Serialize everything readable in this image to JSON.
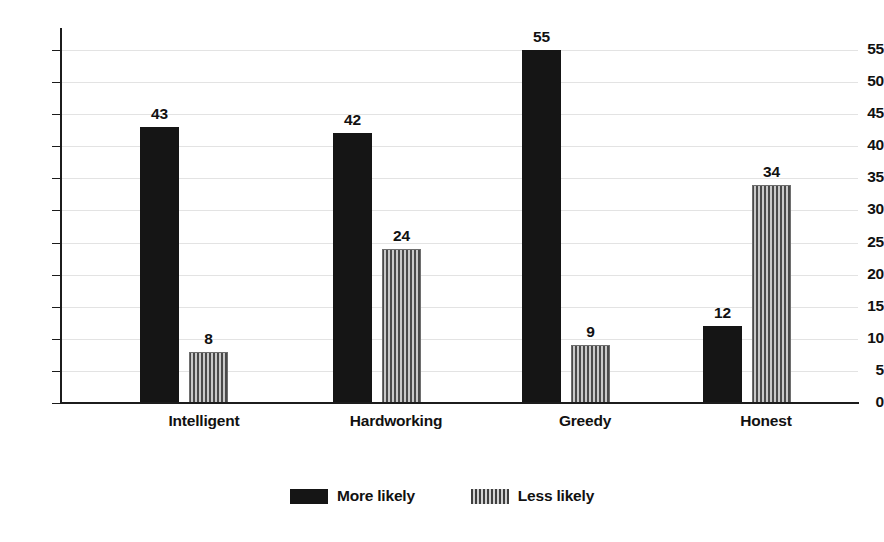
{
  "chart_data": {
    "type": "bar",
    "title": "",
    "subtitle": "",
    "xlabel": "",
    "ylabel": "",
    "categories": [
      "Intelligent",
      "Hardworking",
      "Greedy",
      "Honest"
    ],
    "series": [
      {
        "name": "More likely",
        "values": [
          43,
          42,
          55,
          12
        ],
        "fill": "solid",
        "color": "#151515"
      },
      {
        "name": "Less likely",
        "values": [
          8,
          24,
          9,
          34
        ],
        "fill": "vertical-stripes",
        "color": "#8a8a8a"
      }
    ],
    "ylim": [
      0,
      57
    ],
    "y_ticks": [
      0,
      5,
      10,
      15,
      20,
      25,
      30,
      35,
      40,
      45,
      50,
      55
    ],
    "y_tick_labels": [
      "0",
      "5",
      "10",
      "15",
      "20",
      "25",
      "30",
      "35",
      "40",
      "45",
      "50",
      "55"
    ],
    "grid": true,
    "grid_axis": "y",
    "grid_color": "#e3e3e3",
    "data_labels": true,
    "data_label_values": [
      [
        "43",
        "8"
      ],
      [
        "42",
        "24"
      ],
      [
        "55",
        "9"
      ],
      [
        "12",
        "34"
      ]
    ],
    "legend": {
      "position": "bottom-center",
      "entries": [
        {
          "label": "More likely",
          "swatch": "solid-black"
        },
        {
          "label": "Less likely",
          "swatch": "striped-gray"
        }
      ]
    },
    "background_color": "#ffffff",
    "axis_color": "#1c1c1c"
  }
}
